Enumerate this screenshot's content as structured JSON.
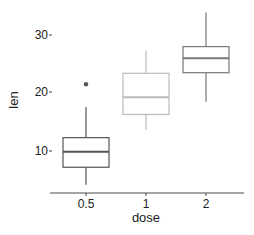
{
  "chart_data": {
    "type": "box",
    "title": "",
    "xlabel": "dose",
    "ylabel": "len",
    "categories": [
      "0.5",
      "1",
      "2"
    ],
    "yticks": [
      10,
      20,
      30
    ],
    "ylim": [
      2.5,
      35
    ],
    "grid": false,
    "legend": null,
    "series": [
      {
        "name": "0.5",
        "color": "#555555",
        "whisker_low": 4.2,
        "q1": 7.2,
        "median": 9.85,
        "q3": 12.3,
        "whisker_high": 17.6,
        "outliers": [
          21.5
        ]
      },
      {
        "name": "1",
        "color": "#bbbbbb",
        "whisker_low": 13.6,
        "q1": 16.3,
        "median": 19.25,
        "q3": 23.4,
        "whisker_high": 27.3,
        "outliers": []
      },
      {
        "name": "2",
        "color": "#777777",
        "whisker_low": 18.5,
        "q1": 23.5,
        "median": 26.0,
        "q3": 28.0,
        "whisker_high": 33.9,
        "outliers": []
      }
    ]
  },
  "labels": {
    "xlabel": "dose",
    "ylabel": "len",
    "xticks": [
      "0.5",
      "1",
      "2"
    ],
    "yticks": [
      "10",
      "20",
      "30"
    ]
  }
}
